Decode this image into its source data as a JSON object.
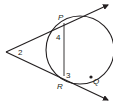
{
  "diagram": {
    "type": "circle with two tangents from external point",
    "points": {
      "P": "P",
      "R": "R",
      "Q": "Q"
    },
    "angles": {
      "angle2": "2",
      "angle3": "3",
      "angle4": "4"
    },
    "colors": {
      "stroke": "#231f20",
      "background": "#ffffff"
    }
  }
}
